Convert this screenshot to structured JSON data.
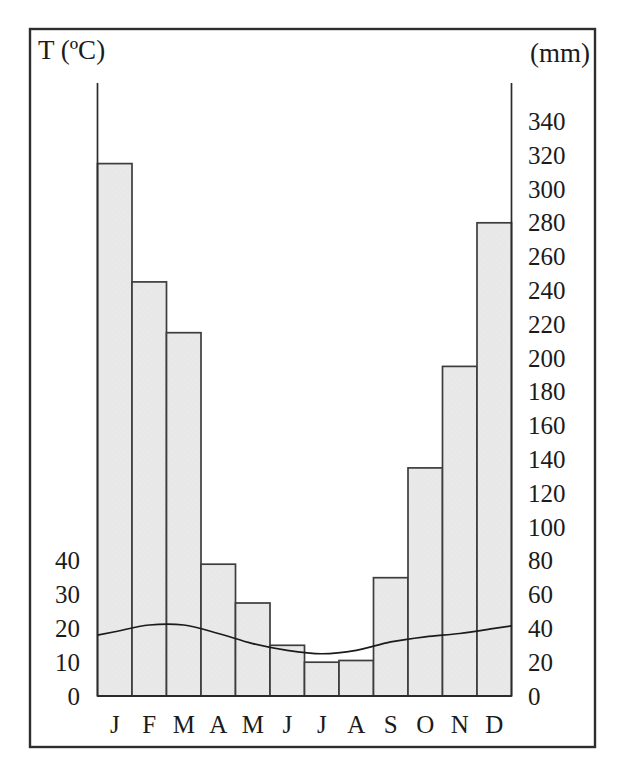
{
  "chart_data": {
    "type": "combo",
    "subtype": "climograph (Walter-Gaussen climate diagram, P = 2T axis alignment)",
    "months": [
      "J",
      "F",
      "M",
      "A",
      "M",
      "J",
      "J",
      "A",
      "S",
      "O",
      "N",
      "D"
    ],
    "series": [
      {
        "name": "precipitation",
        "type": "bar",
        "unit": "mm",
        "values": [
          315,
          245,
          215,
          78,
          55,
          30,
          20,
          21,
          70,
          135,
          195,
          280
        ]
      },
      {
        "name": "temperature",
        "type": "line",
        "unit": "ºC",
        "values": [
          19,
          21,
          21,
          18.5,
          15.5,
          13.5,
          12.5,
          13.5,
          16,
          17.5,
          18.5,
          20
        ]
      }
    ],
    "left_axis": {
      "label": "T (ºC)",
      "unit": "ºC",
      "ticks": [
        0,
        10,
        20,
        30,
        40
      ],
      "range": [
        0,
        40
      ]
    },
    "right_axis": {
      "label": "(mm)",
      "unit": "mm",
      "ticks": [
        0,
        20,
        40,
        60,
        80,
        100,
        120,
        140,
        160,
        180,
        200,
        220,
        240,
        260,
        280,
        300,
        320,
        340
      ],
      "range": [
        0,
        340
      ]
    },
    "title": "",
    "grid": false,
    "legend": "none",
    "colors": {
      "ink": "#1b1b1b",
      "axis": "#2b2b2b",
      "frame": "#2e2e2e",
      "bar_fill_base": "#f1f1f1",
      "bar_fill_dot": "#e0e0e0",
      "bar_stroke": "#3d3d3d",
      "background": "#ffffff"
    }
  }
}
